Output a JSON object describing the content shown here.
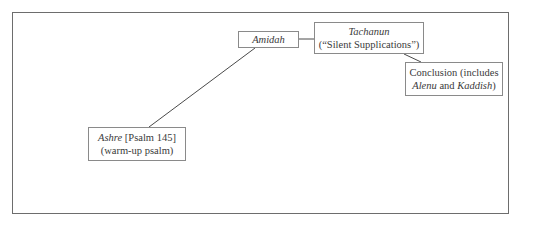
{
  "diagram": {
    "type": "flow",
    "frame_color": "#6d6d6d",
    "node_border_color": "#8a8a8a",
    "line_color": "#4a4a4a",
    "nodes": {
      "ashre": {
        "line1_italic": "Ashre",
        "line1_rest": " [Psalm 145]",
        "line2": "(warm-up psalm)"
      },
      "amidah": {
        "label_italic": "Amidah"
      },
      "tachanun": {
        "line1_italic": "Tachanun",
        "line2": "(“Silent Supplications”)"
      },
      "conclusion": {
        "line1": "Conclusion (includes",
        "line2_italic_a": "Alenu",
        "line2_mid": " and ",
        "line2_italic_b": "Kaddish",
        "line2_end": ")"
      }
    },
    "edges": [
      {
        "from": "ashre",
        "to": "amidah"
      },
      {
        "from": "amidah",
        "to": "tachanun"
      },
      {
        "from": "tachanun",
        "to": "conclusion"
      }
    ]
  }
}
